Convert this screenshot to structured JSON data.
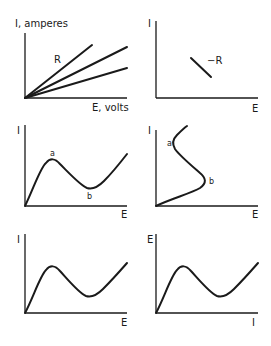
{
  "panels": [
    {
      "id": "p1",
      "ylabel": "I, amperes",
      "xlabel": "E, volts",
      "annotations": [
        "R"
      ],
      "description": "Three straight lines through origin with different slopes (ohmic resistances)"
    },
    {
      "id": "p2",
      "ylabel": "I",
      "xlabel": "E",
      "annotations": [
        "−R"
      ],
      "description": "Short line segment with negative slope (negative resistance)"
    },
    {
      "id": "p3",
      "ylabel": "I",
      "xlabel": "E",
      "annotations": [
        "a",
        "b"
      ],
      "description": "N-shaped I vs E curve with peak a and valley b"
    },
    {
      "id": "p4",
      "ylabel": "I",
      "xlabel": "E",
      "annotations": [
        "a",
        "b"
      ],
      "description": "S-shaped I vs E curve with turning points a and b"
    },
    {
      "id": "p5",
      "ylabel": "I",
      "xlabel": "E",
      "annotations": [],
      "description": "N-shaped I vs E curve"
    },
    {
      "id": "p6",
      "ylabel": "E",
      "xlabel": "I",
      "annotations": [],
      "description": "N-shaped E vs I curve"
    }
  ],
  "colors": {
    "ink": "#1a1a1a",
    "background": "#ffffff"
  }
}
